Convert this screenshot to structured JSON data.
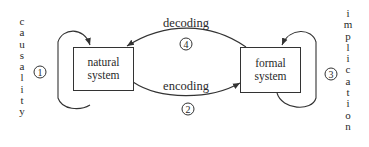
{
  "diagram": {
    "nodes": {
      "natural": {
        "line1": "natural",
        "line2": "system"
      },
      "formal": {
        "line1": "formal",
        "line2": "system"
      }
    },
    "edges": {
      "decoding": {
        "label": "decoding",
        "number": "4"
      },
      "encoding": {
        "label": "encoding",
        "number": "2"
      },
      "causality": {
        "label": "causality",
        "letters": [
          "c",
          "a",
          "u",
          "s",
          "a",
          "l",
          "i",
          "t",
          "y"
        ],
        "number": "1"
      },
      "implication": {
        "label": "implication",
        "letters": [
          "i",
          "m",
          "p",
          "l",
          "i",
          "c",
          "a",
          "t",
          "i",
          "o",
          "n"
        ],
        "number": "3"
      }
    },
    "colors": {
      "stroke": "#333333",
      "background": "#ffffff"
    }
  }
}
